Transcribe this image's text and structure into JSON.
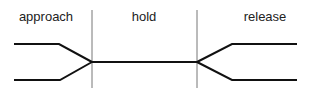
{
  "diagram": {
    "phases": [
      {
        "label": "approach",
        "x": 46
      },
      {
        "label": "hold",
        "x": 144
      },
      {
        "label": "release",
        "x": 265
      }
    ],
    "dividers": [
      92,
      197
    ],
    "colors": {
      "line": "#111111",
      "divider": "#777777",
      "text": "#222222"
    }
  }
}
